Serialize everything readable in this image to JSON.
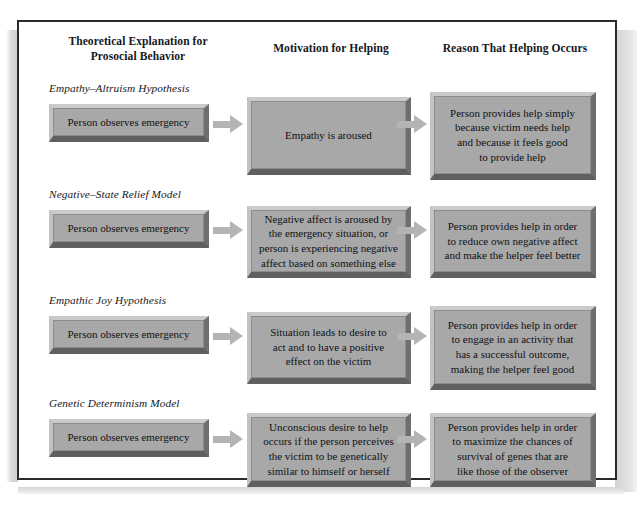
{
  "figure": {
    "headers": [
      "Theoretical Explanation for\nProsocial Behavior",
      "Motivation for Helping",
      "Reason That Helping Occurs"
    ],
    "arrow_icon": "right-arrow-icon",
    "rows": [
      {
        "title": "Empathy–Altruism Hypothesis",
        "trigger": "Person observes emergency",
        "motivation": "Empathy is aroused",
        "reason": "Person provides help simply\nbecause victim needs help\nand because it feels good\nto provide help"
      },
      {
        "title": "Negative–State Relief Model",
        "trigger": "Person observes emergency",
        "motivation": "Negative affect is aroused by\nthe emergency situation, or\nperson is experiencing negative\naffect based on something else",
        "reason": "Person provides help in order\nto reduce own negative affect\nand make the helper feel better"
      },
      {
        "title": "Empathic Joy Hypothesis",
        "trigger": "Person observes emergency",
        "motivation": "Situation leads to desire to\nact and to have a positive\neffect on the victim",
        "reason": "Person provides help in order\nto engage in an activity that\nhas a successful outcome,\nmaking the helper feel good"
      },
      {
        "title": "Genetic Determinism Model",
        "trigger": "Person observes emergency",
        "motivation": "Unconscious desire to help\noccurs if the person perceives\nthe victim to be genetically\nsimilar to himself or herself",
        "reason": "Person provides help in order\nto maximize the chances of\nsurvival of genes that are\nlike those of the observer"
      }
    ]
  },
  "colors": {
    "frame_border": "#2b2b2b",
    "box_face": "#a8a8a8",
    "box_highlight": "#cacaca",
    "box_shadow": "#5f5f5f",
    "arrow": "#b4b4b4",
    "text": "#16181c",
    "page_background": "#ffffff"
  }
}
